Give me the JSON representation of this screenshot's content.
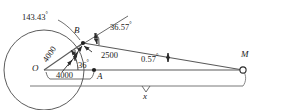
{
  "figure": {
    "type": "geometry-diagram",
    "stroke_color": "#444444",
    "text_color": "#1a1a1a",
    "background": "#ffffff"
  },
  "points": {
    "O": "O",
    "A": "A",
    "B": "B",
    "M": "M"
  },
  "angles": {
    "at_B_exterior": "143.43",
    "at_B_to_M": "36.57",
    "at_O": "36",
    "at_M": "0.57",
    "degree_symbol": "°"
  },
  "lengths": {
    "OB": "4000",
    "OA": "4000",
    "BM_offset": "2500",
    "baseline": "x"
  },
  "icons": {
    "vertex_marker": "filled-dot",
    "M_marker": "open-circle",
    "arrowhead": "arrow-head"
  }
}
